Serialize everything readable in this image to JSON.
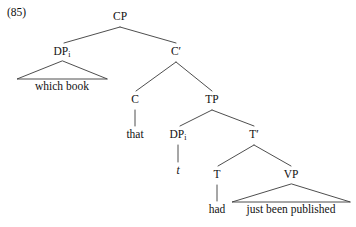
{
  "figure": {
    "example_number": "(85)",
    "width": 356,
    "height": 227,
    "background_color": "#ffffff",
    "line_color": "#3a3a3a",
    "text_color": "#111111"
  },
  "tree": {
    "type": "syntax-tree",
    "sentence": "which book that t had just been published",
    "nodes": {
      "cp": {
        "label": "CP",
        "x": 120,
        "y": 12
      },
      "dp_spec": {
        "label": "DP",
        "subscript": "i",
        "x": 62,
        "y": 47
      },
      "cbar": {
        "label": "C",
        "prime": "′",
        "x": 176,
        "y": 47
      },
      "c_head": {
        "label": "C",
        "x": 135,
        "y": 95
      },
      "tp": {
        "label": "TP",
        "x": 212,
        "y": 95
      },
      "dp_trace": {
        "label": "DP",
        "subscript": "i",
        "x": 178,
        "y": 130
      },
      "tbar": {
        "label": "T",
        "prime": "′",
        "x": 254,
        "y": 130
      },
      "t_head": {
        "label": "T",
        "x": 217,
        "y": 170
      },
      "vp": {
        "label": "VP",
        "x": 291,
        "y": 170
      }
    },
    "terminals": {
      "which_book": {
        "text": "which book",
        "x": 62,
        "y": 82
      },
      "that": {
        "text": "that",
        "x": 135,
        "y": 130
      },
      "trace": {
        "text": "t",
        "x": 178,
        "y": 166,
        "italic": true
      },
      "had": {
        "text": "had",
        "x": 217,
        "y": 205
      },
      "just_been_published": {
        "text": "just been published",
        "x": 291,
        "y": 205
      }
    },
    "triangles": [
      {
        "name": "which-book-triangle",
        "apex_x": 62,
        "apex_y": 60,
        "left_x": 17,
        "right_x": 107,
        "base_y": 79
      },
      {
        "name": "vp-triangle",
        "apex_x": 291,
        "apex_y": 183,
        "left_x": 232,
        "right_x": 350,
        "base_y": 202
      }
    ],
    "branches": [
      {
        "name": "cp-to-dp",
        "from": "cp",
        "to": "dp_spec"
      },
      {
        "name": "cp-to-cbar",
        "from": "cp",
        "to": "cbar"
      },
      {
        "name": "cbar-to-c",
        "from": "cbar",
        "to": "c_head"
      },
      {
        "name": "cbar-to-tp",
        "from": "cbar",
        "to": "tp"
      },
      {
        "name": "c-to-that",
        "from": "c_head",
        "to": "that"
      },
      {
        "name": "tp-to-dp-trace",
        "from": "tp",
        "to": "dp_trace"
      },
      {
        "name": "tp-to-tbar",
        "from": "tp",
        "to": "tbar"
      },
      {
        "name": "dp-trace-to-t",
        "from": "dp_trace",
        "to": "trace"
      },
      {
        "name": "tbar-to-t-head",
        "from": "tbar",
        "to": "t_head"
      },
      {
        "name": "tbar-to-vp",
        "from": "tbar",
        "to": "vp"
      },
      {
        "name": "t-head-to-had",
        "from": "t_head",
        "to": "had"
      }
    ]
  }
}
